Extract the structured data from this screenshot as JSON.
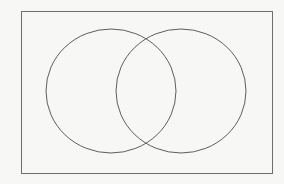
{
  "diagram": {
    "type": "venn",
    "colors": {
      "background": "#f7f7f5",
      "rectangle_stroke": "#6e6e6e",
      "circle_stroke": "#5e5e5e"
    },
    "universe": {
      "x": 21,
      "y": 11,
      "width": 251,
      "height": 162
    },
    "sets": [
      {
        "name": "left-set",
        "cx": 111,
        "cy": 91,
        "rx": 65,
        "ry": 62,
        "label": ""
      },
      {
        "name": "right-set",
        "cx": 181,
        "cy": 91,
        "rx": 65,
        "ry": 62,
        "label": ""
      }
    ],
    "intersections": [
      {
        "x": 147,
        "y": 39
      },
      {
        "x": 147,
        "y": 143
      }
    ]
  }
}
